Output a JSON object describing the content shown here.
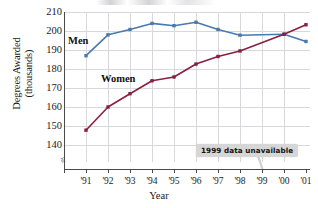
{
  "chart_data": {
    "type": "line",
    "title": "",
    "xlabel": "Year",
    "ylabel": "Degrees Awarded\n(thousands)",
    "categories": [
      "'91",
      "'92",
      "'93",
      "'94",
      "'95",
      "'96",
      "'97",
      "'98",
      "'99",
      "'00",
      "'01"
    ],
    "xlim": [
      "'91",
      "'01"
    ],
    "ylim": [
      135,
      210
    ],
    "yticks": [
      140,
      150,
      160,
      170,
      180,
      190,
      200,
      210
    ],
    "grid": true,
    "axis_break": true,
    "legend": "inline-labels",
    "series": [
      {
        "name": "Men",
        "color": "#4a79ae",
        "values": [
          187,
          198,
          200.8,
          204,
          202.8,
          204.6,
          200.8,
          197.8,
          null,
          198.3,
          194.5
        ]
      },
      {
        "name": "Women",
        "color": "#8a2040",
        "values": [
          147.8,
          160,
          167,
          173.8,
          175.8,
          182.6,
          186.6,
          189.5,
          null,
          198.3,
          203.3
        ]
      }
    ],
    "annotations": [
      {
        "text": "1999 data unavailable",
        "points_to": "'99",
        "background": "#d6d6d6"
      }
    ]
  },
  "axis": {
    "y_tick_labels": [
      "210",
      "200",
      "190",
      "180",
      "170",
      "160",
      "150",
      "140"
    ],
    "x_tick_labels": [
      "'91",
      "'92",
      "'93",
      "'94",
      "'95",
      "'96",
      "'97",
      "'98",
      "'99",
      "'00",
      "'01"
    ],
    "x_title": "Year",
    "y_title": "Degrees Awarded\n(thousands)",
    "break_glyph": "≈"
  },
  "series_labels": {
    "men": "Men",
    "women": "Women"
  },
  "annotation": {
    "text": "1999 data unavailable"
  },
  "colors": {
    "men": "#4a79ae",
    "women": "#8a2040",
    "grid": "#d8d8dc",
    "axis": "#4a4a4a",
    "callout_bg": "#d6d6d6"
  }
}
